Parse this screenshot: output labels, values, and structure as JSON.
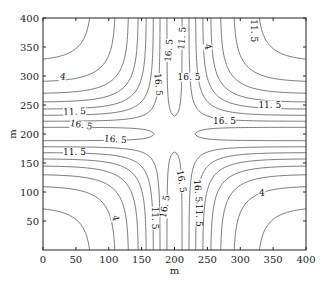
{
  "chart_data": {
    "type": "contour",
    "title": "",
    "xlabel": "m",
    "ylabel": "m",
    "xlim": [
      0,
      400
    ],
    "ylim": [
      0,
      400
    ],
    "xticks": [
      0,
      50,
      100,
      150,
      200,
      250,
      300,
      350,
      400
    ],
    "yticks": [
      50,
      100,
      150,
      200,
      250,
      300,
      350,
      400
    ],
    "grid": false,
    "legend": null,
    "contour_levels": [
      1.5,
      4,
      6.5,
      9,
      11.5,
      14,
      16.5,
      19
    ],
    "labeled_levels": [
      "4",
      "11.5",
      "16.5"
    ],
    "field_model": {
      "description": "saddle-shaped cross ridge centered at (200,200); high along x=200 and y=200, low in corners",
      "center": [
        200,
        200
      ],
      "amplitude": 21,
      "scale": 62,
      "exponent": 1.37,
      "coupling": 1.14
    },
    "contour_labels": [
      {
        "text": "4",
        "x": 30,
        "y": 298,
        "rot": 10
      },
      {
        "text": "11.5",
        "x": 48,
        "y": 238,
        "rot": -2
      },
      {
        "text": "16.5",
        "x": 58,
        "y": 215,
        "rot": 10
      },
      {
        "text": "16.5",
        "x": 110,
        "y": 190,
        "rot": 5
      },
      {
        "text": "11.5",
        "x": 320,
        "y": 378,
        "rot": 90
      },
      {
        "text": "16.5",
        "x": 192,
        "y": 344,
        "rot": -85
      },
      {
        "text": "11.5",
        "x": 212,
        "y": 365,
        "rot": -85
      },
      {
        "text": "16.5",
        "x": 175,
        "y": 285,
        "rot": 85
      },
      {
        "text": "4",
        "x": 250,
        "y": 350,
        "rot": 75
      },
      {
        "text": "11.5",
        "x": 345,
        "y": 250,
        "rot": 0
      },
      {
        "text": "16.5",
        "x": 276,
        "y": 222,
        "rot": 0
      },
      {
        "text": "16.5",
        "x": 222,
        "y": 298,
        "rot": 0
      },
      {
        "text": "16.5",
        "x": 235,
        "y": 102,
        "rot": 85
      },
      {
        "text": "11.5",
        "x": 48,
        "y": 168,
        "rot": 0
      },
      {
        "text": "4",
        "x": 110,
        "y": 55,
        "rot": 80
      },
      {
        "text": "11.5",
        "x": 170,
        "y": 55,
        "rot": 90
      },
      {
        "text": "16.5",
        "x": 186,
        "y": 75,
        "rot": -80
      },
      {
        "text": "11.5",
        "x": 236,
        "y": 60,
        "rot": 90
      },
      {
        "text": "4",
        "x": 333,
        "y": 98,
        "rot": 0
      },
      {
        "text": "16.5",
        "x": 210,
        "y": 118,
        "rot": 80
      }
    ]
  },
  "colors": {
    "line": "#555555",
    "axis": "#222222",
    "background": "#ffffff"
  },
  "layout": {
    "plot_left": 43,
    "plot_top": 18,
    "plot_right": 306,
    "plot_bottom": 250
  }
}
